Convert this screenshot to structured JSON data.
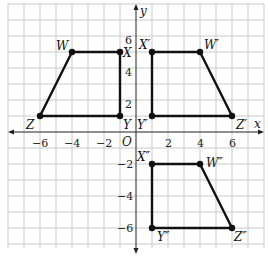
{
  "diagram": {
    "type": "coordinate-plane",
    "axes": {
      "x_label": "x",
      "y_label": "y",
      "origin_label": "O"
    },
    "x_ticks": [
      {
        "value": -6,
        "label": "−6"
      },
      {
        "value": -4,
        "label": "−4"
      },
      {
        "value": -2,
        "label": "−2"
      },
      {
        "value": 2,
        "label": "2"
      },
      {
        "value": 4,
        "label": "4"
      },
      {
        "value": 6,
        "label": "6"
      }
    ],
    "y_ticks": [
      {
        "value": 6,
        "label": "6"
      },
      {
        "value": 4,
        "label": "4"
      },
      {
        "value": 2,
        "label": "2"
      },
      {
        "value": -2,
        "label": "−2"
      },
      {
        "value": -4,
        "label": "−4"
      },
      {
        "value": -6,
        "label": "−6"
      }
    ],
    "figures": [
      {
        "name": "WXYZ",
        "vertices": [
          {
            "label": "W",
            "x": -4,
            "y": 5
          },
          {
            "label": "X",
            "x": -1,
            "y": 5
          },
          {
            "label": "Y",
            "x": -1,
            "y": 1
          },
          {
            "label": "Z",
            "x": -6,
            "y": 1
          }
        ]
      },
      {
        "name": "W'X'Y'Z'",
        "vertices": [
          {
            "label": "W′",
            "x": 4,
            "y": 5
          },
          {
            "label": "X′",
            "x": 1,
            "y": 5
          },
          {
            "label": "Y′",
            "x": 1,
            "y": 1
          },
          {
            "label": "Z′",
            "x": 6,
            "y": 1
          }
        ]
      },
      {
        "name": "W''X''Y''Z''",
        "vertices": [
          {
            "label": "W″",
            "x": 4,
            "y": -2
          },
          {
            "label": "X″",
            "x": 1,
            "y": -2
          },
          {
            "label": "Y″",
            "x": 1,
            "y": -6
          },
          {
            "label": "Z″",
            "x": 6,
            "y": -6
          }
        ]
      }
    ]
  }
}
